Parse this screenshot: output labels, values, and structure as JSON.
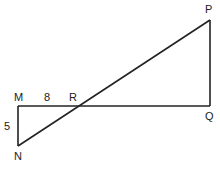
{
  "diagram": {
    "type": "geometry-figure",
    "points": {
      "M": {
        "label": "M",
        "x": 18,
        "y": 106
      },
      "N": {
        "label": "N",
        "x": 18,
        "y": 146
      },
      "R": {
        "label": "R",
        "x": 77,
        "y": 106
      },
      "Q": {
        "label": "Q",
        "x": 210,
        "y": 106
      },
      "P": {
        "label": "P",
        "x": 210,
        "y": 20
      }
    },
    "segments": [
      {
        "from": "M",
        "to": "Q"
      },
      {
        "from": "M",
        "to": "N"
      },
      {
        "from": "N",
        "to": "P"
      },
      {
        "from": "P",
        "to": "Q"
      }
    ],
    "measurements": {
      "MR": "8",
      "MN": "5"
    },
    "stroke_color": "#222222"
  }
}
